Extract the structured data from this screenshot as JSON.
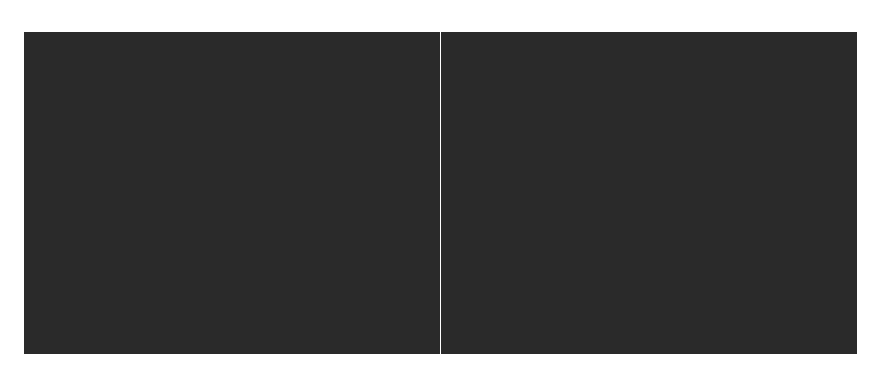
{
  "figure": {
    "background_color": "#ffffff",
    "panels": [
      {
        "id": "left",
        "variant": "aliased",
        "filtering": "point-sampled",
        "sky_color": "#3c3c3c",
        "wall_color": "#1a1a1a",
        "mortar_color": "#7a7a7a",
        "floor_dark": "#000000",
        "floor_light": "#ffffff",
        "horizon_y_frac": 0.17,
        "wall_edge_top_x_frac": 0.7,
        "wall_edge_bottom_x_frac": 0.33,
        "noise": 1.0
      },
      {
        "id": "right",
        "variant": "anti-aliased",
        "filtering": "filtered",
        "sky_color": "#3a3a3a",
        "wall_color": "#1c1c1c",
        "mortar_color": "#6c6c6c",
        "floor_dark": "#000000",
        "floor_light": "#ffffff",
        "horizon_y_frac": 0.17,
        "wall_edge_top_x_frac": 0.7,
        "wall_edge_bottom_x_frac": 0.28,
        "noise": 0.25
      }
    ]
  }
}
